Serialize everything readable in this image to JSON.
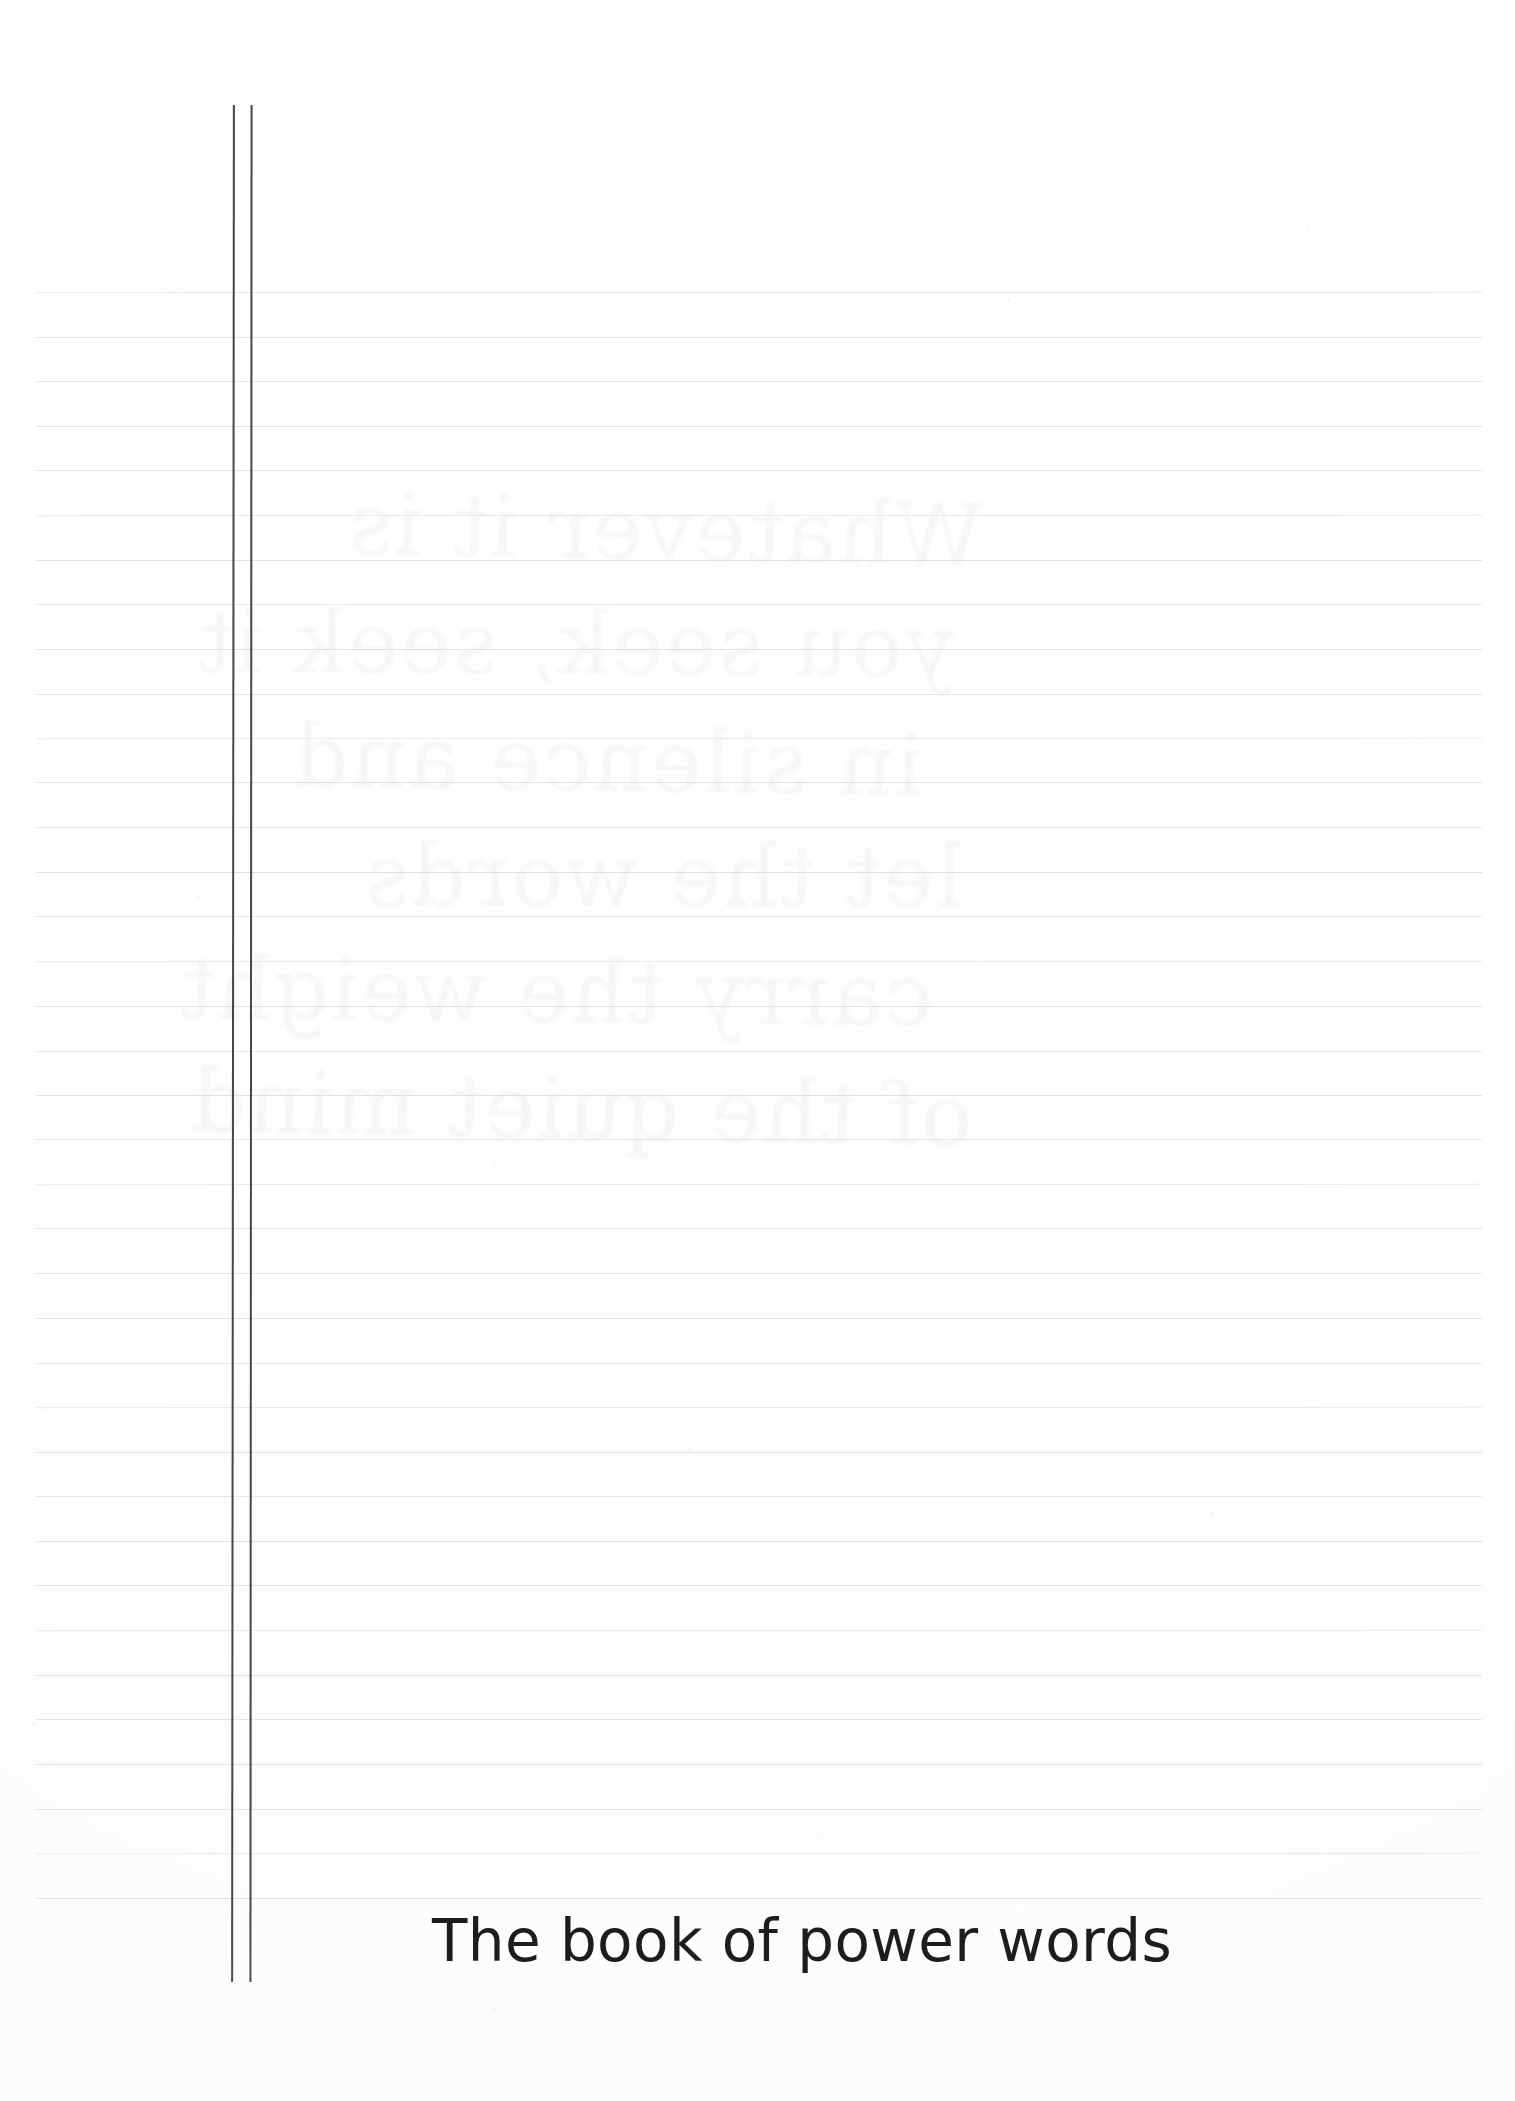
{
  "page": {
    "kind": "lined-notebook-page",
    "width": 1515,
    "height": 2101,
    "background_color": "#ffffff",
    "rule_line_color": "#d9dade",
    "margin_rule_color": "#33363c",
    "title_color": "#1d1d1f"
  },
  "title": {
    "text": "The book of power words",
    "font_size_px": 58,
    "left_px": 432,
    "baseline_y_px": 1952
  },
  "margin_rules": {
    "count": 2,
    "x_positions_px": [
      232,
      250
    ],
    "top_px": 105,
    "bottom_px": 1982,
    "thickness_px": 1.6
  },
  "ruled_lines": {
    "count": 37,
    "first_y_px": 292,
    "spacing_px": 44.6,
    "left_px": 36,
    "right_px": 1482,
    "thickness_px": 1
  },
  "ghost_writing": {
    "note": "very faint bleed-through of handwriting from the reverse side of the sheet",
    "lines": [
      "Whatever it is",
      "you seek, seek it",
      "in silence and",
      "let the words",
      "carry the weight",
      "of the quiet mind"
    ],
    "left_px": 180,
    "top_px": 470,
    "font_size_px": 86,
    "opacity": 0.115
  }
}
